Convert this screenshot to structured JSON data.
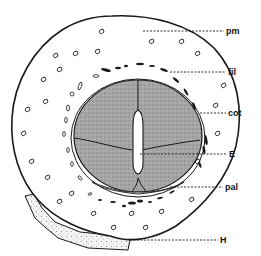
{
  "figure": {
    "type": "botanical cross-section",
    "labels": [
      {
        "id": "pm",
        "text": "pm",
        "x": 226,
        "y": 27,
        "line_from_x": 143,
        "line_y": 31
      },
      {
        "id": "fil",
        "text": "fil",
        "x": 228,
        "y": 68,
        "line_from_x": 170,
        "line_y": 72
      },
      {
        "id": "cot",
        "text": "cot",
        "x": 228,
        "y": 109,
        "line_from_x": 200,
        "line_y": 113
      },
      {
        "id": "E",
        "text": "E",
        "x": 229,
        "y": 150,
        "line_from_x": 140,
        "line_y": 154
      },
      {
        "id": "pal",
        "text": "pal",
        "x": 225,
        "y": 183,
        "line_from_x": 170,
        "line_y": 187
      },
      {
        "id": "H",
        "text": "H",
        "x": 220,
        "y": 236,
        "line_from_x": 130,
        "line_y": 240
      }
    ],
    "colors": {
      "ink": "#1a1a1a",
      "cotyledon_fill": "#9a9a9a",
      "background": "#ffffff",
      "hilum_fill": "#d8d8d8"
    }
  }
}
